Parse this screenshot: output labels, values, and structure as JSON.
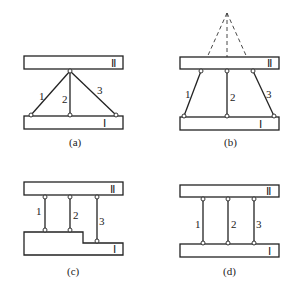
{
  "figure": {
    "panels": [
      {
        "id": "a",
        "caption": "(a)",
        "body_top_label": "Ⅱ",
        "body_bottom_label": "Ⅰ",
        "links": [
          "1",
          "2",
          "3"
        ],
        "description": "three links meeting at a single pin on body II"
      },
      {
        "id": "b",
        "caption": "(b)",
        "body_top_label": "Ⅱ",
        "body_bottom_label": "Ⅰ",
        "links": [
          "1",
          "2",
          "3"
        ],
        "description": "three links whose extensions (dashed) meet at a common point above body II"
      },
      {
        "id": "c",
        "caption": "(c)",
        "body_top_label": "Ⅱ",
        "body_bottom_label": "Ⅰ",
        "links": [
          "1",
          "2",
          "3"
        ],
        "description": "three parallel links of unequal length; body I is stepped"
      },
      {
        "id": "d",
        "caption": "(d)",
        "body_top_label": "Ⅱ",
        "body_bottom_label": "Ⅰ",
        "links": [
          "1",
          "2",
          "3"
        ],
        "description": "three parallel links of equal length"
      }
    ]
  }
}
